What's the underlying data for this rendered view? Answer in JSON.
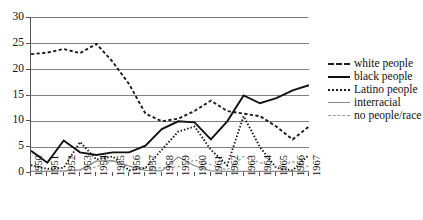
{
  "chart_data": {
    "type": "line",
    "title": "",
    "xlabel": "",
    "ylabel": "",
    "x": [
      1950,
      1951,
      1952,
      1953,
      1954,
      1955,
      1956,
      1957,
      1958,
      1959,
      1960,
      1961,
      1962,
      1963,
      1964,
      1965,
      1966,
      1967
    ],
    "xticklabels": [
      "1950",
      "1951",
      "1952",
      "1953",
      "1954",
      "1955",
      "1956",
      "1957",
      "1958",
      "1959",
      "1960",
      "1961",
      "1962",
      "1963",
      "1964",
      "1965",
      "1966",
      "1967"
    ],
    "yticklabels": [
      "0",
      "5",
      "10",
      "15",
      "20",
      "25",
      "30"
    ],
    "yticks": [
      0,
      5,
      10,
      15,
      20,
      25,
      30
    ],
    "ylim": [
      0,
      30
    ],
    "xlim": [
      1950,
      1967
    ],
    "grid": "horizontal",
    "legend_position": "right",
    "series": [
      {
        "name": "white people",
        "style": "dashed",
        "color": "#1a1a1a",
        "values": [
          23.0,
          23.3,
          24.0,
          23.2,
          25.0,
          21.5,
          17.2,
          11.5,
          10.0,
          10.5,
          12.0,
          14.0,
          12.0,
          11.5,
          11.0,
          9.0,
          6.5,
          9.0
        ]
      },
      {
        "name": "black people",
        "style": "solid",
        "color": "#111111",
        "values": [
          4.3,
          2.0,
          6.3,
          4.0,
          3.5,
          4.0,
          4.0,
          5.3,
          8.5,
          10.0,
          9.8,
          6.5,
          10.0,
          15.0,
          13.5,
          14.5,
          16.0,
          17.0
        ]
      },
      {
        "name": "Latino people",
        "style": "dotted",
        "color": "#1a1a1a",
        "values": [
          1.5,
          0.8,
          1.0,
          6.0,
          2.6,
          3.2,
          0.5,
          1.0,
          4.5,
          8.0,
          9.0,
          4.5,
          1.5,
          11.0,
          5.0,
          1.0,
          0.5,
          3.5
        ]
      },
      {
        "name": "interracial",
        "style": "solid-thin",
        "color": "#8a8a8a",
        "values": [
          0.3,
          0.3,
          0.4,
          0.6,
          2.3,
          2.4,
          1.3,
          0.5,
          0.4,
          3.1,
          1.4,
          0.4,
          0.3,
          0.3,
          0.3,
          0.3,
          0.3,
          0.3
        ]
      },
      {
        "name": "no people/race",
        "style": "dashed-thin",
        "color": "#9a9a9a",
        "values": [
          0.3,
          0.4,
          0.4,
          0.5,
          1.2,
          2.3,
          1.4,
          0.9,
          1.0,
          1.2,
          2.5,
          1.6,
          0.6,
          3.2,
          2.0,
          1.2,
          2.2,
          1.2
        ]
      }
    ]
  },
  "legend": {
    "items": [
      {
        "label": "white people"
      },
      {
        "label": "black people"
      },
      {
        "label": "Latino people"
      },
      {
        "label": "interracial"
      },
      {
        "label": "no people/race"
      }
    ]
  }
}
